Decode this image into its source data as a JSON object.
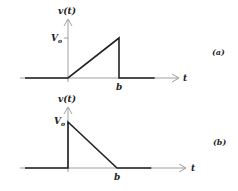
{
  "figure": {
    "panels": [
      {
        "id": "a",
        "panel_label": "(a)",
        "y_axis_label": "v(t)",
        "x_axis_label": "t",
        "level_label": "V",
        "level_sub": "o",
        "b_label": "b",
        "description": "Ramp rising from 0 at t=0 to Vo at t=b, then dropping to 0",
        "points": [
          [
            -1,
            0
          ],
          [
            0,
            0
          ],
          [
            1,
            1
          ],
          [
            1,
            0
          ],
          [
            1.7,
            0
          ]
        ]
      },
      {
        "id": "b",
        "panel_label": "(b)",
        "y_axis_label": "v(t)",
        "x_axis_label": "t",
        "level_label": "V",
        "level_sub": "o",
        "b_label": "b",
        "description": "Jumps to Vo at t=0, then decreases linearly to 0 at t=b",
        "points": [
          [
            -1,
            0
          ],
          [
            0,
            0
          ],
          [
            0,
            1
          ],
          [
            1,
            0
          ],
          [
            1.7,
            0
          ]
        ]
      }
    ]
  }
}
